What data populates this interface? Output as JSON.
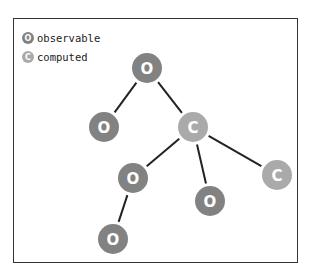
{
  "legend": {
    "items": [
      {
        "glyph": "O",
        "label": "observable",
        "color": "#828282"
      },
      {
        "glyph": "C",
        "label": "computed",
        "color": "#aaaaaa"
      }
    ]
  },
  "graph": {
    "node_radius": 15,
    "edge_color": "#222222",
    "nodes": [
      {
        "id": "n1",
        "kind": "observable",
        "glyph": "O",
        "x": 147,
        "y": 68
      },
      {
        "id": "n2",
        "kind": "observable",
        "glyph": "O",
        "x": 104,
        "y": 127
      },
      {
        "id": "n3",
        "kind": "computed",
        "glyph": "C",
        "x": 193,
        "y": 127
      },
      {
        "id": "n4",
        "kind": "observable",
        "glyph": "O",
        "x": 133,
        "y": 178
      },
      {
        "id": "n5",
        "kind": "observable",
        "glyph": "O",
        "x": 210,
        "y": 201
      },
      {
        "id": "n6",
        "kind": "computed",
        "glyph": "C",
        "x": 277,
        "y": 175
      },
      {
        "id": "n7",
        "kind": "observable",
        "glyph": "O",
        "x": 113,
        "y": 239
      }
    ],
    "edges": [
      [
        "n1",
        "n2"
      ],
      [
        "n1",
        "n3"
      ],
      [
        "n3",
        "n4"
      ],
      [
        "n3",
        "n5"
      ],
      [
        "n3",
        "n6"
      ],
      [
        "n4",
        "n7"
      ]
    ]
  }
}
